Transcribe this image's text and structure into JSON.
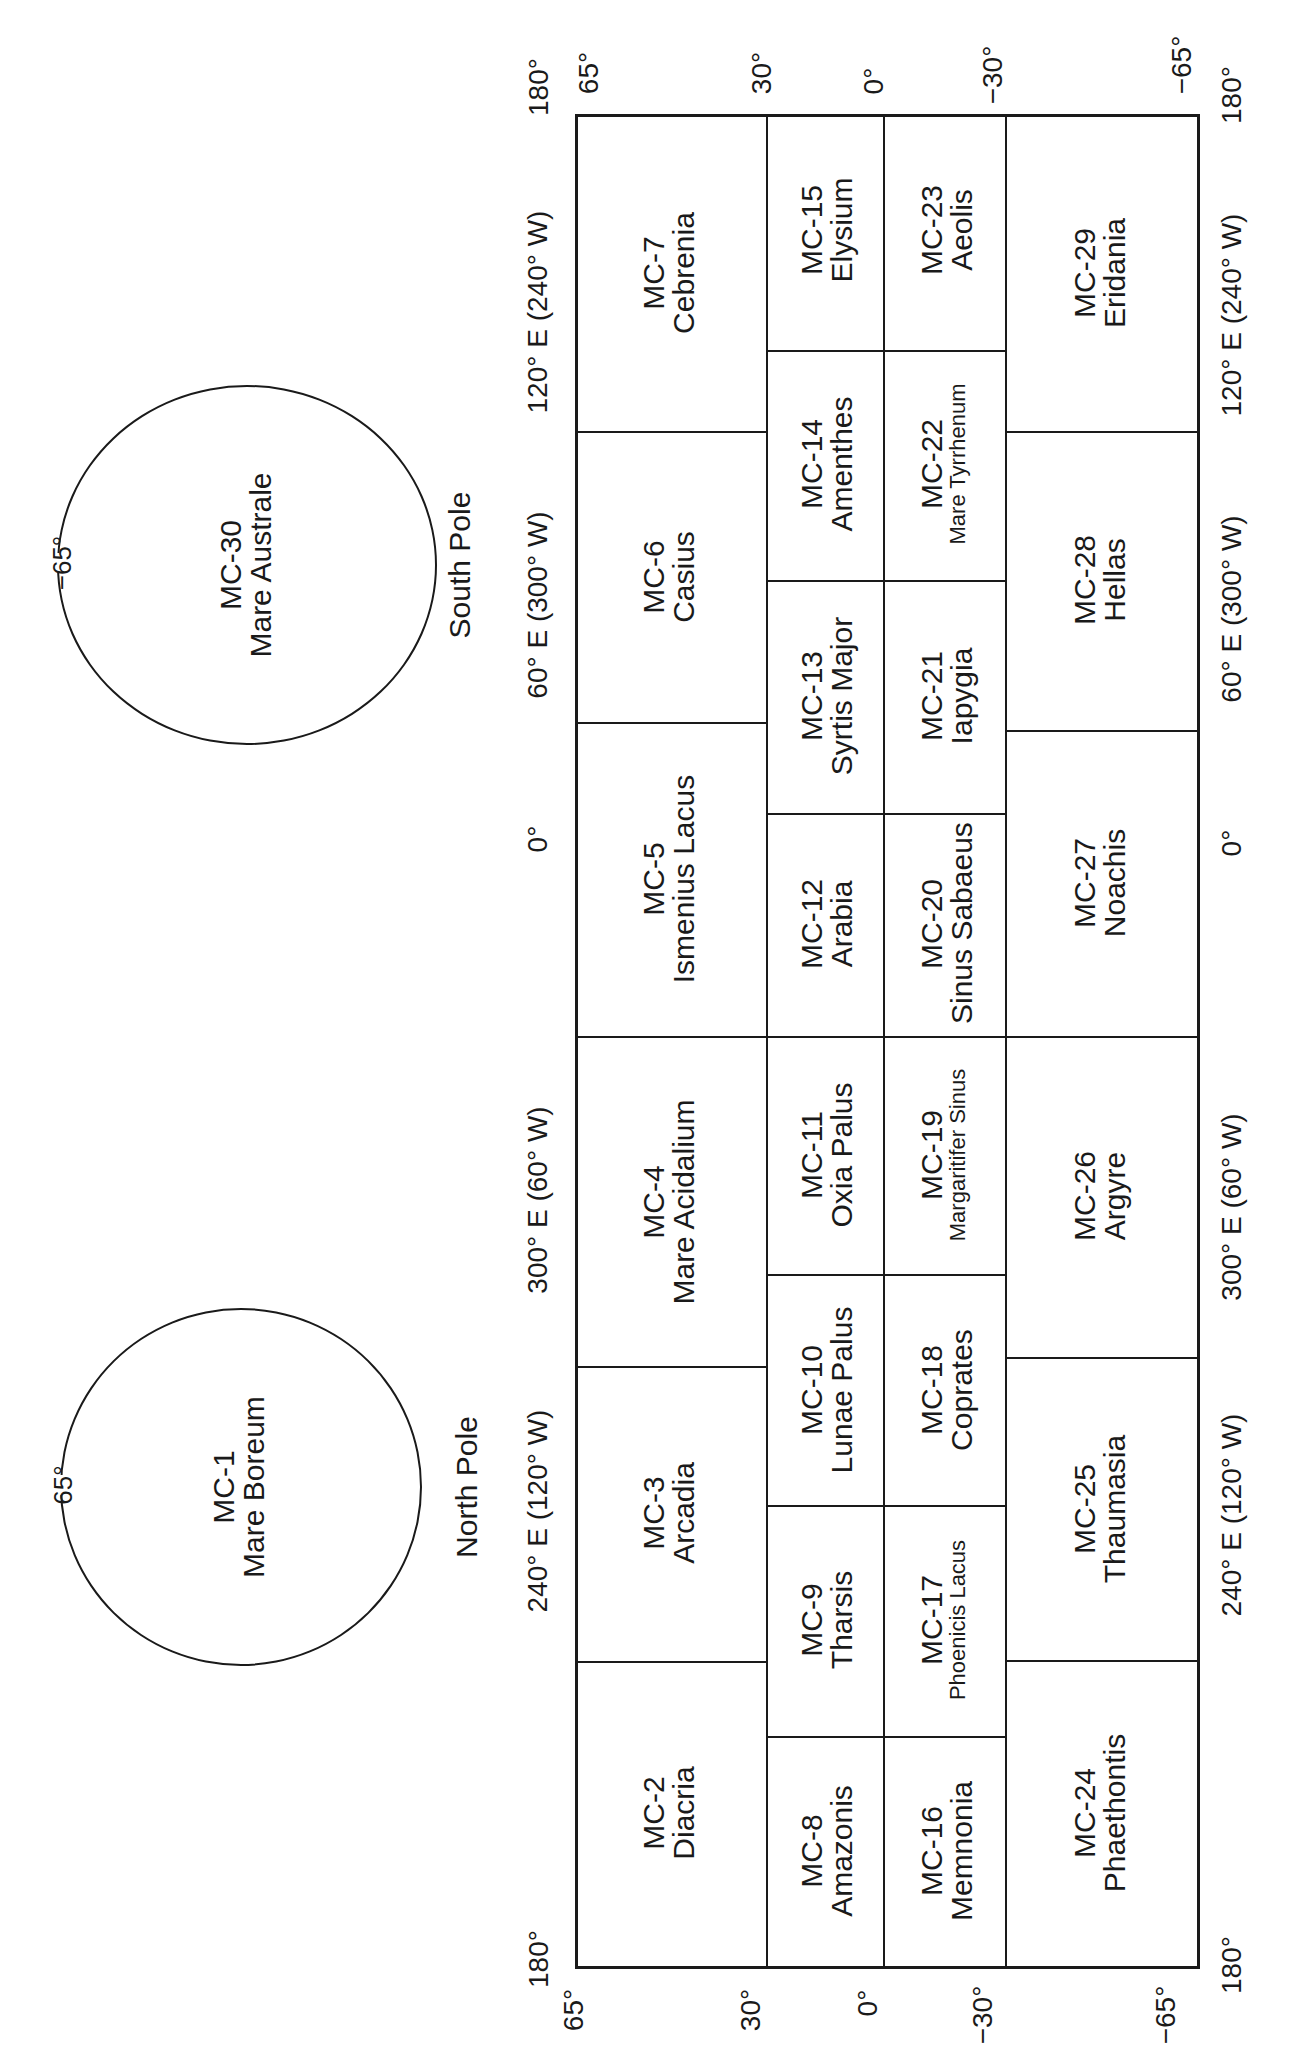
{
  "figure": {
    "orientation": "rotated -90deg",
    "line_color": "#1a1a1a",
    "background": "#ffffff"
  },
  "poles": {
    "south": {
      "title": "South Pole",
      "id": "MC-30",
      "name": "Mare Australe",
      "boundary_label": "−65°"
    },
    "north": {
      "title": "North Pole",
      "id": "MC-1",
      "name": "Mare Boreum",
      "boundary_label": "65°"
    }
  },
  "latitude_labels": {
    "top": [
      "65°",
      "30°",
      "0°",
      "−30°",
      "−65°"
    ],
    "bottom": [
      "65°",
      "30°",
      "0°",
      "−30°",
      "−65°"
    ]
  },
  "longitude_labels": {
    "left": [
      "180°",
      "120° E (240° W)",
      "60° E (300° W)",
      "0°",
      "300° E (60° W)",
      "240° E (120° W)",
      "180°"
    ],
    "right": [
      "180°",
      "120° E (240° W)",
      "60° E (300° W)",
      "0°",
      "300° E (60° W)",
      "240° E (120° W)",
      "180°"
    ]
  },
  "bands": {
    "north": {
      "lat_range": "30° to 65°",
      "cells": [
        {
          "id": "MC-7",
          "name": "Cebrenia"
        },
        {
          "id": "MC-6",
          "name": "Casius"
        },
        {
          "id": "MC-5",
          "name": "Ismenius Lacus"
        },
        {
          "id": "MC-4",
          "name": "Mare Acidalium"
        },
        {
          "id": "MC-3",
          "name": "Arcadia"
        },
        {
          "id": "MC-2",
          "name": "Diacria"
        }
      ]
    },
    "north_equatorial": {
      "lat_range": "0° to 30°",
      "cells": [
        {
          "id": "MC-15",
          "name": "Elysium"
        },
        {
          "id": "MC-14",
          "name": "Amenthes"
        },
        {
          "id": "MC-13",
          "name": "Syrtis Major"
        },
        {
          "id": "MC-12",
          "name": "Arabia"
        },
        {
          "id": "MC-11",
          "name": "Oxia Palus"
        },
        {
          "id": "MC-10",
          "name": "Lunae Palus"
        },
        {
          "id": "MC-9",
          "name": "Tharsis"
        },
        {
          "id": "MC-8",
          "name": "Amazonis"
        }
      ]
    },
    "south_equatorial": {
      "lat_range": "−30° to 0°",
      "cells": [
        {
          "id": "MC-23",
          "name": "Aeolis"
        },
        {
          "id": "MC-22",
          "name": "Mare Tyrrhenum"
        },
        {
          "id": "MC-21",
          "name": "Iapygia"
        },
        {
          "id": "MC-20",
          "name": "Sinus Sabaeus"
        },
        {
          "id": "MC-19",
          "name": "Margaritifer Sinus"
        },
        {
          "id": "MC-18",
          "name": "Coprates"
        },
        {
          "id": "MC-17",
          "name": "Phoenicis Lacus"
        },
        {
          "id": "MC-16",
          "name": "Memnonia"
        }
      ]
    },
    "south": {
      "lat_range": "−65° to −30°",
      "cells": [
        {
          "id": "MC-29",
          "name": "Eridania"
        },
        {
          "id": "MC-28",
          "name": "Hellas"
        },
        {
          "id": "MC-27",
          "name": "Noachis"
        },
        {
          "id": "MC-26",
          "name": "Argyre"
        },
        {
          "id": "MC-25",
          "name": "Thaumasia"
        },
        {
          "id": "MC-24",
          "name": "Phaethontis"
        }
      ]
    }
  }
}
